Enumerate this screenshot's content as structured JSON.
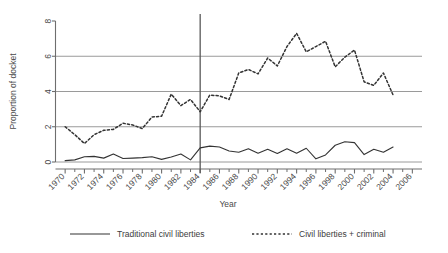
{
  "chart_data": {
    "type": "line",
    "title": "",
    "xlabel": "Year",
    "ylabel": "Proportion of docket",
    "xlim": [
      1969,
      2007
    ],
    "ylim": [
      0,
      8
    ],
    "yticks": [
      0,
      2,
      4,
      6,
      8
    ],
    "ytick_labels": [
      "0",
      "2",
      "4",
      "6",
      "8"
    ],
    "xticks": [
      1970,
      1972,
      1974,
      1976,
      1978,
      1980,
      1982,
      1984,
      1986,
      1988,
      1990,
      1992,
      1994,
      1996,
      1998,
      2000,
      2002,
      2004,
      2006
    ],
    "xtick_labels": [
      "1970",
      "1972",
      "1974",
      "1976",
      "1978",
      "1980",
      "1982",
      "1984",
      "1986",
      "1988",
      "1990",
      "1992",
      "1994",
      "1996",
      "1998",
      "2000",
      "2002",
      "2004",
      "2006"
    ],
    "xtick_minor": [
      1971,
      1973,
      1975,
      1977,
      1979,
      1981,
      1983,
      1985,
      1987,
      1989,
      1991,
      1993,
      1995,
      1997,
      1999,
      2001,
      2003,
      2005
    ],
    "grid": "horizontal",
    "gridlines_y": [
      2,
      4,
      6
    ],
    "legend_position": "bottom",
    "annotations": [
      {
        "type": "vline",
        "x": 1984,
        "label": ""
      }
    ],
    "x": [
      1970,
      1971,
      1972,
      1973,
      1974,
      1975,
      1976,
      1977,
      1978,
      1979,
      1980,
      1981,
      1982,
      1983,
      1984,
      1985,
      1986,
      1987,
      1988,
      1989,
      1990,
      1991,
      1992,
      1993,
      1994,
      1995,
      1996,
      1997,
      1998,
      1999,
      2000,
      2001,
      2002,
      2003,
      2004
    ],
    "series": [
      {
        "name": "Traditional civil liberties",
        "style": "solid",
        "color": "#333333",
        "values": [
          0.08,
          0.12,
          0.3,
          0.32,
          0.22,
          0.45,
          0.2,
          0.22,
          0.25,
          0.3,
          0.15,
          0.28,
          0.45,
          0.12,
          0.8,
          0.9,
          0.85,
          0.62,
          0.55,
          0.75,
          0.5,
          0.72,
          0.48,
          0.75,
          0.5,
          0.78,
          0.18,
          0.4,
          0.95,
          1.15,
          1.1,
          0.42,
          0.72,
          0.55,
          0.85
        ]
      },
      {
        "name": "Civil liberties + criminal",
        "style": "dashed",
        "color": "#333333",
        "values": [
          2.0,
          1.55,
          1.05,
          1.55,
          1.8,
          1.85,
          2.2,
          2.1,
          1.9,
          2.55,
          2.6,
          3.85,
          3.2,
          3.55,
          2.85,
          3.8,
          3.75,
          3.55,
          5.05,
          5.25,
          5.0,
          5.9,
          5.45,
          6.55,
          7.3,
          6.25,
          6.55,
          6.85,
          5.4,
          5.95,
          6.35,
          4.55,
          4.35,
          5.05,
          3.8
        ]
      }
    ]
  },
  "legend": {
    "items": [
      {
        "label": "Traditional civil liberties",
        "style": "solid"
      },
      {
        "label": "Civil liberties + criminal",
        "style": "dashed"
      }
    ]
  }
}
